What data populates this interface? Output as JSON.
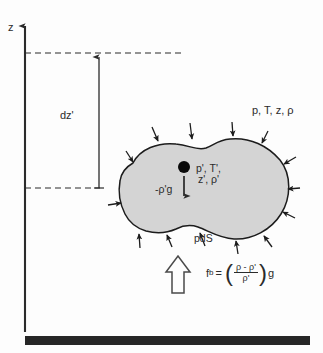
{
  "figure": {
    "width": 323,
    "height": 353,
    "background_color": "#fdfdfd",
    "line_color": "#2b2b2b",
    "parcel_fill_color": "#d4d4d4",
    "ground_color": "#262626"
  },
  "axis": {
    "vertical_label": "z",
    "x_position": 25,
    "top": 22,
    "bottom": 332
  },
  "levels": {
    "upper_dashed_y": 53,
    "lower_dashed_y": 188,
    "separation_label": "dz'"
  },
  "ambient": {
    "label": "p, T, z, ρ"
  },
  "parcel": {
    "label_line1": "p', T',",
    "label_line2": "z', ρ'",
    "weight_label": "-ρ'g",
    "surface_pressure_label": "pdS",
    "fill_color": "#d4d4d4"
  },
  "buoyancy": {
    "symbol": "f",
    "subscript": "b",
    "equals": "=",
    "numerator": "ρ - ρ'",
    "denominator": "ρ'",
    "trailing": "g",
    "open_paren": "(",
    "close_paren": ")"
  },
  "ground": {
    "label": "surface",
    "y": 341,
    "x_start": 25,
    "x_end": 310
  }
}
